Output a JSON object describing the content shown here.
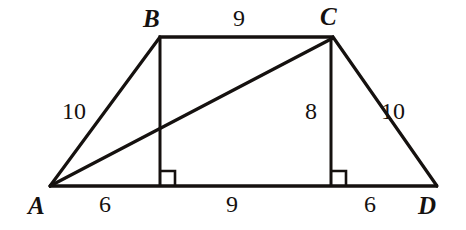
{
  "figure": {
    "kind": "geometry-diagram",
    "stroke_color": "#15110f",
    "background_color": "#ffffff",
    "vertices": [
      {
        "id": "A",
        "label": "A",
        "x": 50,
        "y": 186,
        "label_x": 28,
        "label_y": 195
      },
      {
        "id": "B",
        "label": "B",
        "x": 160,
        "y": 37,
        "label_x": 143,
        "label_y": 8
      },
      {
        "id": "C",
        "label": "C",
        "x": 333,
        "y": 37,
        "label_x": 320,
        "label_y": 6
      },
      {
        "id": "D",
        "label": "D",
        "x": 437,
        "y": 186,
        "label_x": 419,
        "label_y": 195
      }
    ],
    "segments": [
      {
        "id": "AB",
        "from": "A",
        "to": "B",
        "x1": 50,
        "y1": 186,
        "x2": 160,
        "y2": 37
      },
      {
        "id": "BC",
        "from": "B",
        "to": "C",
        "x1": 160,
        "y1": 37,
        "x2": 333,
        "y2": 37
      },
      {
        "id": "CD",
        "from": "C",
        "to": "D",
        "x1": 333,
        "y1": 37,
        "x2": 437,
        "y2": 186
      },
      {
        "id": "AD",
        "from": "A",
        "to": "D",
        "x1": 50,
        "y1": 186,
        "x2": 437,
        "y2": 186
      },
      {
        "id": "AC",
        "from": "A",
        "to": "C",
        "x1": 50,
        "y1": 186,
        "x2": 333,
        "y2": 37
      },
      {
        "id": "B-altitude",
        "from": "B",
        "to": "foot-of-B",
        "x1": 160,
        "y1": 37,
        "x2": 160,
        "y2": 186
      },
      {
        "id": "C-altitude",
        "from": "C",
        "to": "foot-of-C",
        "x1": 331,
        "y1": 37,
        "x2": 331,
        "y2": 186
      }
    ],
    "right_angles": [
      {
        "id": "right-angle-at-foot-of-B",
        "x": 160,
        "y": 186,
        "size": 15,
        "direction": "right"
      },
      {
        "id": "right-angle-at-foot-of-C",
        "x": 331,
        "y": 186,
        "size": 15,
        "direction": "right"
      }
    ],
    "measurements": [
      {
        "id": "AB-length",
        "segment": "AB",
        "value": "10",
        "x": 62,
        "y": 101
      },
      {
        "id": "BC-length",
        "segment": "BC",
        "value": "9",
        "x": 233,
        "y": 8
      },
      {
        "id": "CD-length",
        "segment": "CD",
        "value": "10",
        "x": 382,
        "y": 101
      },
      {
        "id": "C-altitude-length",
        "segment": "C-altitude",
        "value": "8",
        "x": 305,
        "y": 101
      },
      {
        "id": "A-to-footB-length",
        "segment": "A-to-foot-of-B",
        "value": "6",
        "x": 98,
        "y": 194
      },
      {
        "id": "footB-to-footC-length",
        "segment": "foot-of-B-to-foot-of-C",
        "value": "9",
        "x": 225,
        "y": 194
      },
      {
        "id": "footC-to-D-length",
        "segment": "foot-of-C-to-D",
        "value": "6",
        "x": 363,
        "y": 194
      }
    ]
  }
}
